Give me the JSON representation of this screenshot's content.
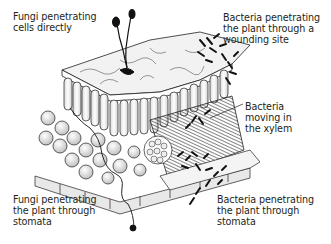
{
  "figure": {
    "labels": {
      "fungi_direct": "Fungi penetrating\ncells directly",
      "bacteria_wound": "Bacteria penetrating\nthe plant through a\nwounding site",
      "bacteria_xylem": "Bacteria\nmoving in\nthe xylem",
      "fungi_stomata": "Fungi penetrating\nthe plant through\nstomata",
      "bacteria_stomata": "Bacteria penetrating\nthe plant through\nstomata"
    },
    "caption": "",
    "colors": {
      "ink": "#231f20",
      "cell_fill": "#e6e6e6",
      "upper_surface": "#f0f0f0",
      "pathogen": "#111111"
    }
  }
}
